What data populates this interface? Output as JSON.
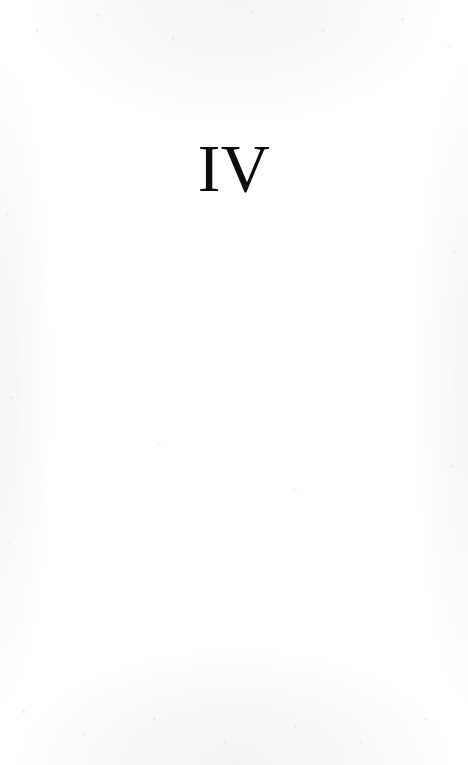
{
  "page": {
    "type": "part-title-page",
    "part_number": "IV",
    "body_text": "",
    "ink_color": "#0d0d0f",
    "paper_color": "#ffffff"
  }
}
